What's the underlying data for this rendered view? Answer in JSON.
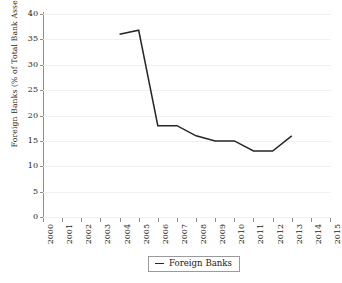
{
  "chart_data": {
    "type": "line",
    "title": "",
    "subtitle": "",
    "xlabel": "",
    "ylabel": "Foreign Banks (% of Total Bank Assets)",
    "x": [
      "2000",
      "2001",
      "2002",
      "2003",
      "2004",
      "2005",
      "2006",
      "2007",
      "2008",
      "2009",
      "2010",
      "2011",
      "2012",
      "2013",
      "2014",
      "2015"
    ],
    "xtick_labels": [
      "2000",
      "2001",
      "2002",
      "2003",
      "2004",
      "2005",
      "2006",
      "2007",
      "2008",
      "2009",
      "2010",
      "2011",
      "2012",
      "2013",
      "2014",
      "2015"
    ],
    "ytick_labels": [
      "0",
      "5",
      "10",
      "15",
      "20",
      "25",
      "30",
      "35",
      "40"
    ],
    "ytick_values": [
      0,
      5,
      10,
      15,
      20,
      25,
      30,
      35,
      40
    ],
    "ylim": [
      0,
      40
    ],
    "grid": "horizontal",
    "legend_position": "bottom-center",
    "series": [
      {
        "name": "Foreign Banks",
        "color": "#262626",
        "points": [
          {
            "x": "2004",
            "y": 36.0
          },
          {
            "x": "2005",
            "y": 36.8
          },
          {
            "x": "2006",
            "y": 18.0
          },
          {
            "x": "2007",
            "y": 18.0
          },
          {
            "x": "2008",
            "y": 16.0
          },
          {
            "x": "2009",
            "y": 15.0
          },
          {
            "x": "2010",
            "y": 15.0
          },
          {
            "x": "2011",
            "y": 13.0
          },
          {
            "x": "2012",
            "y": 13.0
          },
          {
            "x": "2013",
            "y": 16.0
          }
        ]
      }
    ]
  },
  "legend": {
    "entries": [
      {
        "label": "Foreign Banks",
        "marker": "dash",
        "color": "#262626"
      }
    ]
  },
  "colors": {
    "series_line": "#262626",
    "axis": "#8d8d8d",
    "gridline": "#f0f0f0",
    "text": "#1d1d1d",
    "background": "#ffffff"
  }
}
